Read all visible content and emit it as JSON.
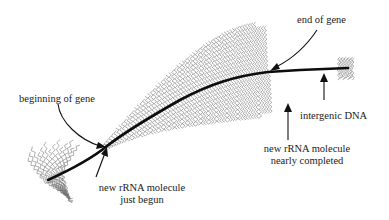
{
  "figure": {
    "type": "rRNA gene transcription (Christmas-tree) diagram",
    "labels": {
      "end_of_gene": "end of gene",
      "beginning_of_gene": "beginning of gene",
      "intergenic_dna": "intergenic DNA",
      "nearly_completed_line1": "new rRNA molecule",
      "nearly_completed_line2": "nearly completed",
      "just_begun_line1": "new rRNA molecule",
      "just_begun_line2": "just begun"
    },
    "colors": {
      "dna_strand": "#0d0d0d",
      "rna_fibers": "#6e6e6e",
      "text": "#1a1a1a",
      "background": "#ffffff"
    }
  }
}
